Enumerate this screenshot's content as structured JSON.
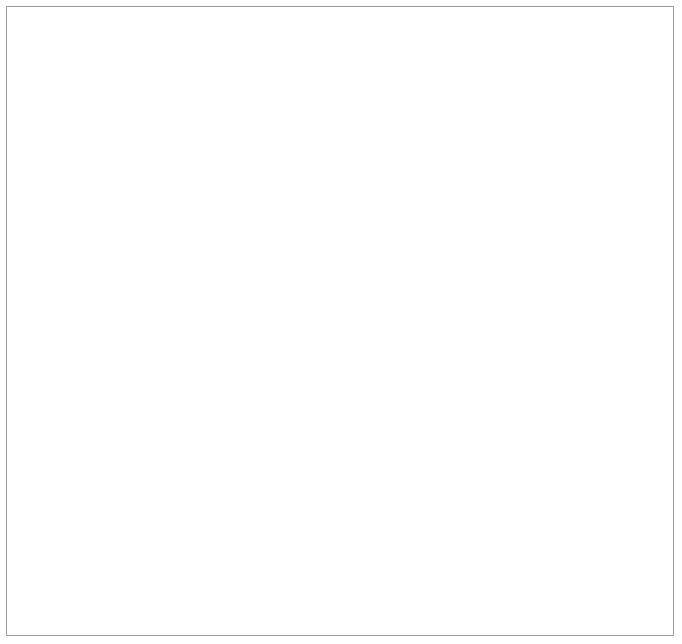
{
  "figure": {
    "background_color": "#ffffff",
    "border_color": "#9a9a9a",
    "observed_color": "#a8a8a8",
    "calculated_color": "#3a3a3a",
    "gridline_color": "#8a8a8a",
    "axis_color": "#1c1c1c"
  },
  "legend": {
    "position": "top-right",
    "items": [
      {
        "label": "Calculated",
        "style": "dashed-line",
        "color": "#3a3a3a"
      },
      {
        "label": "Observed",
        "style": "solid-line-with-markers",
        "color": "#a8a8a8"
      }
    ],
    "calculated_label": "Calculated",
    "observed_label": "Observed"
  },
  "shared": {
    "ylabel_line1": "Platelet count",
    "ylabel_line2_prefix": "(× 10",
    "ylabel_line2_sup": "3",
    "ylabel_line2_suffix": "/µL)",
    "xlabel": "Units of blood transfused"
  },
  "chart_data": [
    {
      "type": "line",
      "panel": "top",
      "title": "",
      "xlabel": "",
      "ylabel": "Platelet count (× 10³/µL)",
      "xlim": [
        0,
        50
      ],
      "ylim": [
        0,
        300
      ],
      "xticks": [
        0,
        10,
        20,
        30,
        40,
        50
      ],
      "xticklabels": [
        "0",
        "10",
        "20",
        "30",
        "40",
        "50"
      ],
      "yticks": [
        0,
        50,
        100,
        200,
        300
      ],
      "yticklabels": [
        "0",
        "50",
        "100",
        "200",
        "300"
      ],
      "grid": "horizontal gridlines at y=50 and y=100 only",
      "gridlines_y": [
        50,
        100
      ],
      "legend_position": "upper right",
      "series": [
        {
          "name": "Observed",
          "style": "solid",
          "markers": true,
          "color": "#a8a8a8",
          "points": [
            {
              "x": 0,
              "y": 228
            },
            {
              "x": 4.5,
              "y": 218
            },
            {
              "x": 10,
              "y": 160
            },
            {
              "x": 15,
              "y": 114
            },
            {
              "x": 20,
              "y": 88
            },
            {
              "x": 25,
              "y": 63
            },
            {
              "x": 30,
              "y": 52
            }
          ]
        },
        {
          "name": "Calculated",
          "style": "dashed",
          "markers": false,
          "color": "#3a3a3a",
          "points": [
            {
              "x": 0,
              "y": 228
            },
            {
              "x": 2.5,
              "y": 196
            },
            {
              "x": 5,
              "y": 168
            },
            {
              "x": 7.5,
              "y": 143
            },
            {
              "x": 10,
              "y": 120
            },
            {
              "x": 12.5,
              "y": 100
            },
            {
              "x": 15,
              "y": 83
            },
            {
              "x": 17.5,
              "y": 68
            },
            {
              "x": 20,
              "y": 55
            },
            {
              "x": 22.5,
              "y": 44
            },
            {
              "x": 25,
              "y": 34
            },
            {
              "x": 27.5,
              "y": 25
            },
            {
              "x": 29.5,
              "y": 18
            }
          ]
        }
      ]
    },
    {
      "type": "line",
      "panel": "bottom",
      "title": "",
      "xlabel": "Units of blood transfused",
      "ylabel": "Platelet count (× 10³/µL)",
      "xlim": [
        0,
        50
      ],
      "ylim": [
        0,
        200
      ],
      "xticks": [
        0,
        10,
        20,
        30,
        40,
        50
      ],
      "xticklabels": [
        "0",
        "10",
        "20",
        "30",
        "40",
        "50"
      ],
      "yticks": [
        0,
        50,
        100,
        200
      ],
      "yticklabels": [
        "0",
        "50",
        "100",
        "200"
      ],
      "grid": "horizontal gridlines at y=50 and y=100 only",
      "gridlines_y": [
        50,
        100
      ],
      "legend_position": "none",
      "series": [
        {
          "name": "Observed",
          "style": "solid",
          "markers": true,
          "color": "#a8a8a8",
          "points": [
            {
              "x": 0,
              "y": 131
            },
            {
              "x": 5.2,
              "y": 118
            },
            {
              "x": 10.5,
              "y": 104
            },
            {
              "x": 15.4,
              "y": 90
            },
            {
              "x": 20.8,
              "y": 75
            },
            {
              "x": 27.0,
              "y": 61
            },
            {
              "x": 34.3,
              "y": 48
            },
            {
              "x": 40.7,
              "y": 41
            },
            {
              "x": 47.5,
              "y": 31
            }
          ]
        },
        {
          "name": "Calculated",
          "style": "dashed",
          "markers": false,
          "color": "#3a3a3a",
          "points": [
            {
              "x": 0,
              "y": 131
            },
            {
              "x": 2.5,
              "y": 106
            },
            {
              "x": 5,
              "y": 85
            },
            {
              "x": 7.5,
              "y": 67
            },
            {
              "x": 10,
              "y": 53
            },
            {
              "x": 12.5,
              "y": 41
            },
            {
              "x": 15,
              "y": 32
            },
            {
              "x": 17.5,
              "y": 24
            },
            {
              "x": 20,
              "y": 18
            },
            {
              "x": 22.5,
              "y": 13
            },
            {
              "x": 25,
              "y": 10
            },
            {
              "x": 27.5,
              "y": 7
            },
            {
              "x": 30,
              "y": 5
            },
            {
              "x": 33,
              "y": 3
            },
            {
              "x": 36,
              "y": 2
            },
            {
              "x": 40,
              "y": 1
            },
            {
              "x": 45,
              "y": 0.5
            },
            {
              "x": 50,
              "y": 0.3
            }
          ]
        }
      ]
    }
  ]
}
